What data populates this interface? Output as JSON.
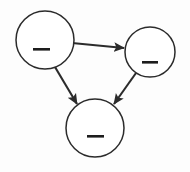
{
  "diagram": {
    "type": "directed-graph",
    "title": "",
    "canvas": {
      "width": 190,
      "height": 172
    },
    "background_color": "#fdfdfd",
    "stroke_color": "#2b2b2b",
    "node_fill_color": "#ffffff",
    "label_bar_color": "#1d1d1d",
    "node_stroke_width": 1.5,
    "edge_stroke_width": 2.1,
    "arrowhead_style": "filled-triangle",
    "nodes": [
      {
        "id": "node-a",
        "name": "top-left-node",
        "label": "",
        "label_redacted": true,
        "cx": 45,
        "cy": 40,
        "r": 29,
        "label_bar": {
          "x": 33,
          "y": 48,
          "width": 17,
          "height": 2.6
        }
      },
      {
        "id": "node-b",
        "name": "top-right-node",
        "label": "",
        "label_redacted": true,
        "cx": 150,
        "cy": 52,
        "r": 25,
        "label_bar": {
          "x": 142,
          "y": 61,
          "width": 16,
          "height": 2.6
        }
      },
      {
        "id": "node-c",
        "name": "bottom-node",
        "label": "",
        "label_redacted": true,
        "cx": 95,
        "cy": 128,
        "r": 29,
        "label_bar": {
          "x": 87,
          "y": 135,
          "width": 17,
          "height": 2.6
        }
      }
    ],
    "edges": [
      {
        "id": "edge-a-b",
        "name": "edge-top-left-to-top-right",
        "from": "node-a",
        "to": "node-b",
        "label": "",
        "directed": true,
        "x1": 72,
        "y1": 43,
        "x2": 124,
        "y2": 48
      },
      {
        "id": "edge-a-c",
        "name": "edge-top-left-to-bottom",
        "from": "node-a",
        "to": "node-c",
        "label": "",
        "directed": true,
        "x1": 55,
        "y1": 67,
        "x2": 77,
        "y2": 104
      },
      {
        "id": "edge-b-c",
        "name": "edge-top-right-to-bottom",
        "from": "node-b",
        "to": "node-c",
        "label": "",
        "directed": true,
        "x1": 136,
        "y1": 73,
        "x2": 114,
        "y2": 104
      }
    ]
  }
}
